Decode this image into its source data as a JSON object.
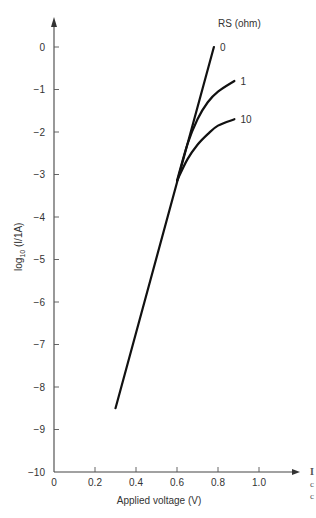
{
  "chart_data": {
    "type": "line",
    "title": "",
    "xlabel": "Applied voltage (V)",
    "ylabel": "log10 (I/1A)",
    "ylabel_parts": {
      "main": "log",
      "sub": "10",
      "rest": " (I/1A)"
    },
    "xlim": [
      0,
      1.15
    ],
    "ylim": [
      -10,
      0.8
    ],
    "xticks": [
      0,
      0.2,
      0.4,
      0.6,
      0.8,
      1.0
    ],
    "xtick_labels": [
      "0",
      "0.2",
      "0.4",
      "0.6",
      "0.8",
      "1.0"
    ],
    "yticks": [
      0,
      -1,
      -2,
      -3,
      -4,
      -5,
      -6,
      -7,
      -8,
      -9,
      -10
    ],
    "ytick_labels": [
      "0",
      "−1",
      "−2",
      "−3",
      "−4",
      "−5",
      "−6",
      "−7",
      "−8",
      "−9",
      "−10"
    ],
    "grid": false,
    "legend_title": "RS (ohm)",
    "legend_position": "top-right",
    "series": [
      {
        "name": "0",
        "label": "0",
        "points": [
          [
            0.3,
            -8.5
          ],
          [
            0.6,
            -3.2
          ],
          [
            0.78,
            0.0
          ]
        ]
      },
      {
        "name": "1",
        "label": "1",
        "points": [
          [
            0.6,
            -3.15
          ],
          [
            0.65,
            -2.3
          ],
          [
            0.7,
            -1.7
          ],
          [
            0.75,
            -1.3
          ],
          [
            0.8,
            -1.05
          ],
          [
            0.88,
            -0.8
          ]
        ]
      },
      {
        "name": "10",
        "label": "10",
        "points": [
          [
            0.6,
            -3.15
          ],
          [
            0.65,
            -2.65
          ],
          [
            0.7,
            -2.3
          ],
          [
            0.75,
            -2.05
          ],
          [
            0.8,
            -1.85
          ],
          [
            0.88,
            -1.7
          ]
        ]
      }
    ]
  },
  "edge_fragments": [
    "I",
    "c",
    "c"
  ]
}
